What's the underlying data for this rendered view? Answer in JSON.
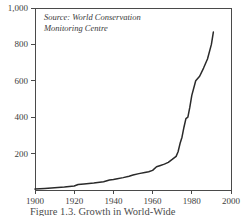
{
  "figure": {
    "background_color": "#ffffff",
    "line_color": "#2a2a2a",
    "axis_color": "#4a4a4a",
    "source_note_line1": "Source: World Conservation",
    "source_note_line2": "Monitoring Centre",
    "caption_partial": "Figure 1.3. Growth in World-Wide"
  },
  "chart_data": {
    "type": "line",
    "title": "",
    "xlabel": "",
    "ylabel": "",
    "xlim": [
      1900,
      2000
    ],
    "ylim": [
      0,
      1000
    ],
    "grid": false,
    "legend": null,
    "annotations": [
      "Source: World Conservation",
      "Monitoring Centre"
    ],
    "xticks": [
      1900,
      1920,
      1940,
      1960,
      1980,
      2000
    ],
    "xtick_labels": [
      "1900",
      "1920",
      "1940",
      "1960",
      "1980",
      "2000"
    ],
    "yticks": [
      200,
      400,
      600,
      800,
      1000
    ],
    "ytick_labels": [
      "200",
      "400",
      "600",
      "800",
      "1,000"
    ],
    "series": [
      {
        "name": "Protected areas",
        "x": [
          1900,
          1905,
          1910,
          1915,
          1920,
          1922,
          1925,
          1930,
          1935,
          1938,
          1940,
          1942,
          1945,
          1948,
          1950,
          1953,
          1956,
          1958,
          1960,
          1962,
          1964,
          1966,
          1968,
          1970,
          1972,
          1973,
          1974,
          1975,
          1976,
          1977,
          1978,
          1979,
          1980,
          1982,
          1984,
          1986,
          1988,
          1990,
          1991
        ],
        "y": [
          5,
          8,
          12,
          16,
          22,
          30,
          33,
          38,
          45,
          55,
          58,
          62,
          68,
          76,
          82,
          90,
          96,
          100,
          108,
          128,
          135,
          142,
          152,
          168,
          185,
          210,
          255,
          290,
          345,
          392,
          400,
          455,
          520,
          600,
          625,
          670,
          720,
          800,
          868
        ]
      }
    ]
  }
}
